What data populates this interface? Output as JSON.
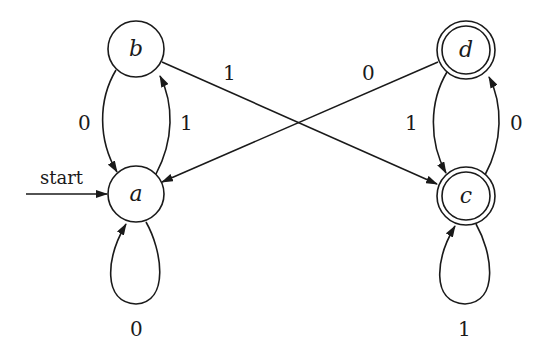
{
  "diagram": {
    "type": "finite-automaton",
    "start_label": "start",
    "start_state": "a",
    "states": [
      {
        "id": "a",
        "label": "a",
        "accepting": false,
        "cx": 136,
        "cy": 194
      },
      {
        "id": "b",
        "label": "b",
        "accepting": false,
        "cx": 136,
        "cy": 49
      },
      {
        "id": "c",
        "label": "c",
        "accepting": true,
        "cx": 466,
        "cy": 196
      },
      {
        "id": "d",
        "label": "d",
        "accepting": true,
        "cx": 466,
        "cy": 50
      }
    ],
    "transitions": [
      {
        "from": "a",
        "to": "a",
        "symbol": "0"
      },
      {
        "from": "a",
        "to": "b",
        "symbol": "1"
      },
      {
        "from": "b",
        "to": "a",
        "symbol": "0"
      },
      {
        "from": "b",
        "to": "c",
        "symbol": "1"
      },
      {
        "from": "c",
        "to": "c",
        "symbol": "1"
      },
      {
        "from": "c",
        "to": "d",
        "symbol": "0"
      },
      {
        "from": "d",
        "to": "c",
        "symbol": "1"
      },
      {
        "from": "d",
        "to": "a",
        "symbol": "0"
      }
    ],
    "edge_labels": {
      "b_to_a": "0",
      "a_to_b": "1",
      "b_to_c": "1",
      "d_to_a": "0",
      "d_to_c": "1",
      "c_to_d": "0",
      "a_loop": "0",
      "c_loop": "1"
    },
    "colors": {
      "stroke": "#1a1a1a",
      "background": "#ffffff"
    }
  }
}
